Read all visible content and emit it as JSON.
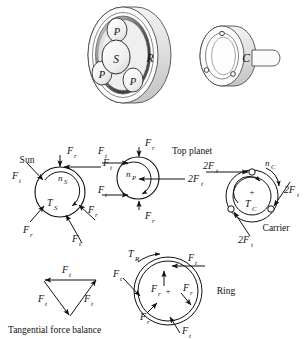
{
  "figure": {
    "background_color": "#ffffff",
    "ink_color": "#111111"
  },
  "assembly": {
    "ring_gear_label": "R",
    "sun_gear_label": "S",
    "planet_labels": [
      "P",
      "P",
      "P"
    ],
    "carrier_label": "C",
    "shading_dark": "#4a4a4a",
    "shading_mid": "#8d8d8d",
    "shading_light": "#cfcfcf",
    "outline_color": "#333333"
  },
  "sun_diagram": {
    "name": "Sun",
    "speed_label": "n",
    "speed_sub": "S",
    "torque_label": "T",
    "torque_sub": "S",
    "forces": [
      {
        "label": "F",
        "sub": "r",
        "position": "top"
      },
      {
        "label": "F",
        "sub": "t",
        "position": "top-right"
      },
      {
        "label": "F",
        "sub": "t",
        "position": "left"
      },
      {
        "label": "F",
        "sub": "r",
        "position": "lower-left"
      },
      {
        "label": "F",
        "sub": "r",
        "position": "right"
      },
      {
        "label": "F",
        "sub": "t",
        "position": "bottom"
      }
    ]
  },
  "planet_diagram": {
    "name": "Top planet",
    "speed_label": "n",
    "speed_sub": "P",
    "forces": [
      {
        "label": "F",
        "sub": "t",
        "position": "upper-left"
      },
      {
        "label": "F",
        "sub": "r",
        "position": "top"
      },
      {
        "label": "F",
        "sub": "t",
        "position": "lower-left"
      },
      {
        "label": "F",
        "sub": "r",
        "position": "bottom"
      },
      {
        "label": "2F",
        "sub": "t",
        "position": "right"
      }
    ]
  },
  "carrier_diagram": {
    "name": "Carrier",
    "speed_label": "n",
    "speed_sub": "C",
    "torque_label": "T",
    "torque_sub": "C",
    "center_marker": "+",
    "forces": [
      {
        "label": "2F",
        "sub": "t",
        "position": "upper-left"
      },
      {
        "label": "2F",
        "sub": "t",
        "position": "right"
      },
      {
        "label": "2F",
        "sub": "t",
        "position": "bottom"
      }
    ]
  },
  "ring_diagram": {
    "name": "Ring",
    "torque_label": "T",
    "torque_sub": "R",
    "center_marker": "+",
    "forces": [
      {
        "label": "F",
        "sub": "t",
        "position": "top"
      },
      {
        "label": "F",
        "sub": "r",
        "position": "top-inner"
      },
      {
        "label": "F",
        "sub": "t",
        "position": "left"
      },
      {
        "label": "F",
        "sub": "r",
        "position": "lower-left"
      },
      {
        "label": "F",
        "sub": "r",
        "position": "right-inner"
      },
      {
        "label": "F",
        "sub": "t",
        "position": "bottom"
      }
    ]
  },
  "triangle_diagram": {
    "caption": "Tangential force balance",
    "forces": [
      {
        "label": "F",
        "sub": "t",
        "position": "top"
      },
      {
        "label": "F",
        "sub": "t",
        "position": "left"
      },
      {
        "label": "F",
        "sub": "t",
        "position": "right"
      }
    ]
  }
}
